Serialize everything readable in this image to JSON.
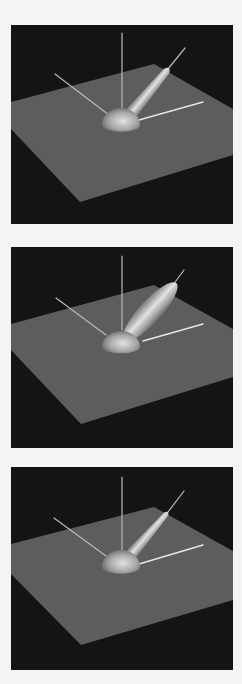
{
  "figure": {
    "page_background": "#f4f4f4",
    "panel_background": "#141414",
    "plane_color": "#5d5d5d",
    "axis_line_color": "#b9b9b9",
    "axis_line_bright_color": "#e6e6e6",
    "surface_highlight": "#e2e2e2",
    "surface_mid": "#a8a8a8",
    "surface_shadow": "#5a5a5a",
    "panels": [
      {
        "id": "panel-1",
        "top": 25,
        "height": 199,
        "plane": [
          [
            0,
            77
          ],
          [
            143,
            39
          ],
          [
            222,
            84
          ],
          [
            222,
            130
          ],
          [
            69,
            177
          ],
          [
            0,
            104
          ]
        ],
        "vertical_axis": [
          111,
          8,
          111,
          84
        ],
        "left_axis": [
          44,
          49,
          98,
          90
        ],
        "right_axis": [
          128,
          95,
          192,
          77
        ],
        "diag_axis": [
          174,
          23,
          157,
          44
        ],
        "hemisphere": {
          "cx": 110,
          "cy": 98,
          "rx": 19,
          "ry": 15
        },
        "lobe": {
          "x1": 119,
          "y1": 90,
          "x2": 158,
          "y2": 43,
          "base_w": 13,
          "tip_w": 7,
          "shape": "tapered"
        }
      },
      {
        "id": "panel-2",
        "top": 247,
        "height": 201,
        "plane": [
          [
            0,
            77
          ],
          [
            143,
            38
          ],
          [
            222,
            82
          ],
          [
            222,
            130
          ],
          [
            70,
            177
          ],
          [
            0,
            103
          ]
        ],
        "vertical_axis": [
          111,
          9,
          111,
          83
        ],
        "left_axis": [
          45,
          51,
          95,
          88
        ],
        "right_axis": [
          132,
          94,
          192,
          77
        ],
        "diag_axis": [
          173,
          23,
          159,
          42
        ],
        "hemisphere": {
          "cx": 110,
          "cy": 98,
          "rx": 19,
          "ry": 14
        },
        "lobe": {
          "x1": 116,
          "y1": 90,
          "x2": 160,
          "y2": 42,
          "base_w": 20,
          "tip_w": 16,
          "shape": "ellipse"
        }
      },
      {
        "id": "panel-3",
        "top": 467,
        "height": 203,
        "plane": [
          [
            0,
            77
          ],
          [
            143,
            40
          ],
          [
            222,
            84
          ],
          [
            222,
            133
          ],
          [
            70,
            178
          ],
          [
            0,
            107
          ]
        ],
        "vertical_axis": [
          111,
          10,
          111,
          83
        ],
        "left_axis": [
          43,
          51,
          95,
          89
        ],
        "right_axis": [
          128,
          97,
          192,
          78
        ],
        "diag_axis": [
          173,
          24,
          157,
          45
        ],
        "hemisphere": {
          "cx": 110,
          "cy": 98,
          "rx": 19,
          "ry": 15
        },
        "lobe": {
          "x1": 119,
          "y1": 89,
          "x2": 157,
          "y2": 45,
          "base_w": 12,
          "tip_w": 5,
          "shape": "tapered"
        }
      }
    ]
  }
}
